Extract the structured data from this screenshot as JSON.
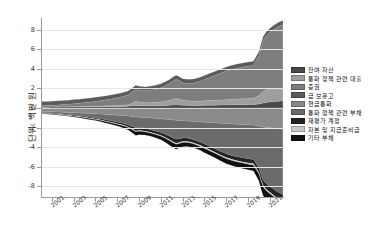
{
  "chart_data": {
    "type": "area",
    "title": "",
    "xlabel": "",
    "ylabel": "단위: 백만 원",
    "xlim": [
      2000.0,
      2022.3
    ],
    "ylim": [
      -9.2,
      9.2
    ],
    "grid": true,
    "legend_position": "right",
    "x_ticks": [
      "2001",
      "2003",
      "2005",
      "2007",
      "2009",
      "2011",
      "2013",
      "2015",
      "2017",
      "2019",
      "2021"
    ],
    "x_tick_values": [
      2001,
      2003,
      2005,
      2007,
      2009,
      2011,
      2013,
      2015,
      2017,
      2019,
      2021
    ],
    "y_ticks": [
      "8",
      "6",
      "4",
      "2",
      "0",
      "-2",
      "-4",
      "-6",
      "-8"
    ],
    "y_tick_values": [
      8,
      6,
      4,
      2,
      0,
      -2,
      -4,
      -6,
      -8
    ],
    "x": [
      2000.0,
      2000.5,
      2001.0,
      2001.5,
      2002.0,
      2002.5,
      2003.0,
      2003.5,
      2004.0,
      2004.5,
      2005.0,
      2005.5,
      2006.0,
      2006.5,
      2007.0,
      2007.5,
      2008.0,
      2008.4,
      2008.7,
      2009.0,
      2009.5,
      2010.0,
      2010.5,
      2011.0,
      2011.4,
      2011.8,
      2012.1,
      2012.4,
      2012.7,
      2013.0,
      2013.4,
      2013.8,
      2014.2,
      2014.6,
      2015.0,
      2015.5,
      2016.0,
      2016.5,
      2017.0,
      2017.5,
      2018.0,
      2018.5,
      2019.0,
      2019.5,
      2020.0,
      2020.2,
      2020.4,
      2020.7,
      2021.0,
      2021.4,
      2021.8,
      2022.2
    ],
    "series": [
      {
        "name": "잔여 자산",
        "side": "asset",
        "color": "#4a4a4a",
        "values": [
          0.08,
          0.08,
          0.09,
          0.09,
          0.1,
          0.1,
          0.11,
          0.11,
          0.12,
          0.12,
          0.13,
          0.13,
          0.14,
          0.14,
          0.15,
          0.16,
          0.17,
          0.22,
          0.26,
          0.24,
          0.22,
          0.22,
          0.23,
          0.24,
          0.26,
          0.28,
          0.3,
          0.31,
          0.3,
          0.28,
          0.27,
          0.26,
          0.26,
          0.26,
          0.27,
          0.28,
          0.29,
          0.3,
          0.31,
          0.32,
          0.33,
          0.34,
          0.35,
          0.36,
          0.4,
          0.46,
          0.52,
          0.58,
          0.62,
          0.66,
          0.7,
          0.74
        ]
      },
      {
        "name": "통화 정책 관련 대출",
        "side": "asset",
        "color": "#9e9e9e",
        "values": [
          0.02,
          0.02,
          0.02,
          0.03,
          0.03,
          0.03,
          0.04,
          0.04,
          0.05,
          0.05,
          0.06,
          0.07,
          0.08,
          0.09,
          0.1,
          0.12,
          0.16,
          0.3,
          0.42,
          0.38,
          0.34,
          0.32,
          0.34,
          0.38,
          0.44,
          0.52,
          0.6,
          0.66,
          0.6,
          0.52,
          0.48,
          0.45,
          0.44,
          0.44,
          0.46,
          0.48,
          0.5,
          0.52,
          0.54,
          0.56,
          0.58,
          0.6,
          0.62,
          0.64,
          0.85,
          1.05,
          1.2,
          1.28,
          1.32,
          1.3,
          1.24,
          1.18
        ]
      },
      {
        "name": "증권",
        "side": "asset",
        "color": "#7d7d7d",
        "values": [
          0.14,
          0.15,
          0.17,
          0.19,
          0.22,
          0.25,
          0.29,
          0.33,
          0.38,
          0.43,
          0.49,
          0.55,
          0.62,
          0.7,
          0.79,
          0.89,
          1.0,
          1.14,
          1.22,
          1.18,
          1.2,
          1.26,
          1.34,
          1.44,
          1.56,
          1.7,
          1.84,
          1.96,
          1.88,
          1.78,
          1.76,
          1.8,
          1.9,
          2.02,
          2.18,
          2.36,
          2.55,
          2.74,
          2.92,
          3.06,
          3.16,
          3.24,
          3.3,
          3.36,
          4.1,
          4.7,
          5.2,
          5.55,
          5.8,
          6.1,
          6.4,
          6.6
        ]
      },
      {
        "name": "금 보유고",
        "side": "asset",
        "color": "#5c5c5c",
        "values": [
          0.42,
          0.42,
          0.42,
          0.42,
          0.42,
          0.42,
          0.42,
          0.42,
          0.42,
          0.42,
          0.42,
          0.42,
          0.42,
          0.42,
          0.42,
          0.42,
          0.42,
          0.42,
          0.42,
          0.42,
          0.42,
          0.42,
          0.42,
          0.42,
          0.42,
          0.42,
          0.42,
          0.42,
          0.42,
          0.42,
          0.42,
          0.42,
          0.42,
          0.42,
          0.42,
          0.42,
          0.42,
          0.42,
          0.42,
          0.42,
          0.42,
          0.42,
          0.42,
          0.42,
          0.42,
          0.42,
          0.42,
          0.42,
          0.42,
          0.42,
          0.42,
          0.42
        ]
      },
      {
        "name": "현금통화",
        "side": "liability",
        "color": "#8a8a8a",
        "values": [
          0.36,
          0.37,
          0.39,
          0.41,
          0.43,
          0.45,
          0.48,
          0.5,
          0.53,
          0.56,
          0.59,
          0.62,
          0.66,
          0.7,
          0.74,
          0.78,
          0.83,
          0.88,
          0.92,
          0.94,
          0.98,
          1.02,
          1.06,
          1.1,
          1.14,
          1.18,
          1.22,
          1.26,
          1.28,
          1.3,
          1.33,
          1.36,
          1.39,
          1.42,
          1.45,
          1.48,
          1.52,
          1.56,
          1.6,
          1.63,
          1.66,
          1.69,
          1.72,
          1.75,
          1.84,
          1.9,
          1.95,
          1.99,
          2.02,
          2.06,
          2.1,
          2.14
        ]
      },
      {
        "name": "통화 정책 관련 부채",
        "side": "liability",
        "color": "#6b6b6b",
        "values": [
          0.1,
          0.11,
          0.13,
          0.15,
          0.18,
          0.21,
          0.24,
          0.28,
          0.32,
          0.37,
          0.42,
          0.48,
          0.55,
          0.62,
          0.7,
          0.79,
          0.9,
          1.02,
          1.1,
          1.06,
          1.1,
          1.18,
          1.28,
          1.4,
          1.54,
          1.7,
          1.84,
          1.94,
          1.86,
          1.76,
          1.74,
          1.8,
          1.92,
          2.06,
          2.24,
          2.44,
          2.66,
          2.88,
          3.08,
          3.22,
          3.32,
          3.4,
          3.46,
          3.52,
          4.3,
          4.95,
          5.45,
          5.78,
          6.0,
          6.28,
          6.55,
          6.7
        ]
      },
      {
        "name": "재평가 계정",
        "side": "liability",
        "color": "#242424",
        "values": [
          0.06,
          0.06,
          0.07,
          0.07,
          0.08,
          0.08,
          0.09,
          0.1,
          0.1,
          0.11,
          0.12,
          0.13,
          0.14,
          0.15,
          0.16,
          0.18,
          0.2,
          0.26,
          0.32,
          0.3,
          0.28,
          0.27,
          0.28,
          0.3,
          0.33,
          0.36,
          0.38,
          0.4,
          0.38,
          0.36,
          0.35,
          0.34,
          0.34,
          0.34,
          0.35,
          0.36,
          0.37,
          0.38,
          0.39,
          0.4,
          0.41,
          0.42,
          0.43,
          0.44,
          0.48,
          0.52,
          0.55,
          0.58,
          0.6,
          0.62,
          0.64,
          0.66
        ]
      },
      {
        "name": "자본 및 지급준비금",
        "side": "liability",
        "color": "#c9c9c9",
        "values": [
          0.03,
          0.03,
          0.03,
          0.03,
          0.04,
          0.04,
          0.04,
          0.04,
          0.05,
          0.05,
          0.05,
          0.05,
          0.06,
          0.06,
          0.06,
          0.07,
          0.07,
          0.08,
          0.08,
          0.08,
          0.08,
          0.08,
          0.09,
          0.09,
          0.09,
          0.1,
          0.1,
          0.1,
          0.1,
          0.1,
          0.1,
          0.1,
          0.1,
          0.11,
          0.11,
          0.11,
          0.11,
          0.12,
          0.12,
          0.12,
          0.12,
          0.12,
          0.13,
          0.13,
          0.13,
          0.13,
          0.14,
          0.14,
          0.14,
          0.14,
          0.15,
          0.15
        ]
      },
      {
        "name": "기타 부채",
        "side": "liability",
        "color": "#111111",
        "values": [
          0.04,
          0.04,
          0.05,
          0.05,
          0.06,
          0.06,
          0.07,
          0.08,
          0.09,
          0.1,
          0.11,
          0.12,
          0.14,
          0.16,
          0.18,
          0.2,
          0.24,
          0.32,
          0.4,
          0.36,
          0.32,
          0.3,
          0.32,
          0.36,
          0.4,
          0.46,
          0.5,
          0.52,
          0.48,
          0.44,
          0.42,
          0.4,
          0.4,
          0.4,
          0.42,
          0.44,
          0.46,
          0.48,
          0.5,
          0.52,
          0.54,
          0.56,
          0.58,
          0.6,
          0.72,
          0.82,
          0.9,
          0.95,
          0.98,
          1.02,
          1.06,
          1.1
        ]
      }
    ]
  },
  "legend": {
    "items": [
      {
        "label": "잔여 자산",
        "color": "#4a4a4a"
      },
      {
        "label": "통화 정책 관련 대출",
        "color": "#9e9e9e"
      },
      {
        "label": "증권",
        "color": "#7d7d7d"
      },
      {
        "label": "금 보유고",
        "color": "#5c5c5c"
      },
      {
        "label": "현금통화",
        "color": "#8a8a8a"
      },
      {
        "label": "통화 정책 관련 부채",
        "color": "#6b6b6b"
      },
      {
        "label": "재평가 계정",
        "color": "#242424"
      },
      {
        "label": "자본 및 지급준비금",
        "color": "#c9c9c9"
      },
      {
        "label": "기타 부채",
        "color": "#111111"
      }
    ]
  }
}
